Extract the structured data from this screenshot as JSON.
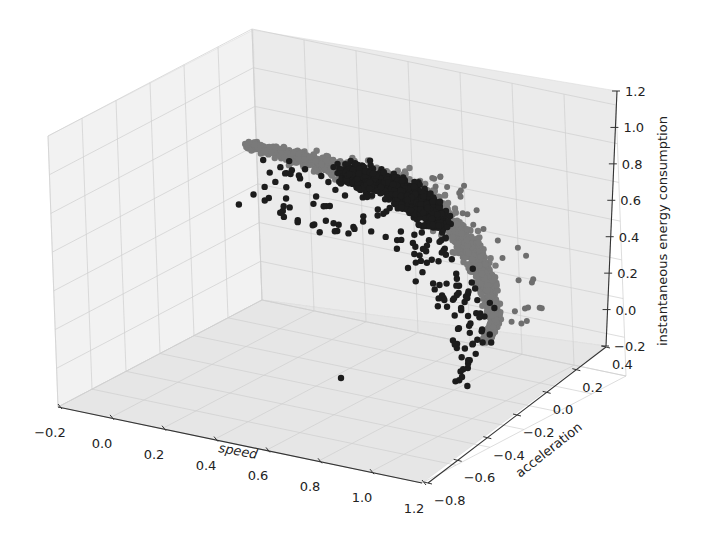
{
  "chart_data": {
    "type": "scatter3d",
    "title": "",
    "xlabel": "speed",
    "ylabel": "acceleration",
    "zlabel": "instantaneous energy consumption",
    "xlim": [
      -0.2,
      1.2
    ],
    "ylim": [
      -0.8,
      0.4
    ],
    "zlim": [
      -0.2,
      1.2
    ],
    "x_ticks": [
      "−0.2",
      "0.0",
      "0.2",
      "0.4",
      "0.6",
      "0.8",
      "1.0",
      "1.2"
    ],
    "y_ticks": [
      "−0.8",
      "−0.6",
      "−0.4",
      "−0.2",
      "0.0",
      "0.2",
      "0.4"
    ],
    "z_ticks": [
      "−0.2",
      "0.0",
      "0.2",
      "0.4",
      "0.6",
      "0.8",
      "1.0",
      "1.2"
    ],
    "grid": true,
    "legend": null,
    "series": [
      {
        "name": "dense cluster (dark)",
        "color": "#1a1a1a",
        "description": "dense dark band of points along the upper arc, roughly speed 0.3-0.6, energy 0.6-1.0"
      },
      {
        "name": "dense cluster (gray)",
        "color": "#7a7a7a",
        "description": "dense gray band continuing from upper-left tip (energy ~1.05) and curving down to energy ~-0.15 at high speed"
      },
      {
        "name": "scattered outliers",
        "color": "#1a1a1a",
        "description": "sparse dark points scattered below/inside the arc, lowest near energy -0.2"
      }
    ]
  }
}
